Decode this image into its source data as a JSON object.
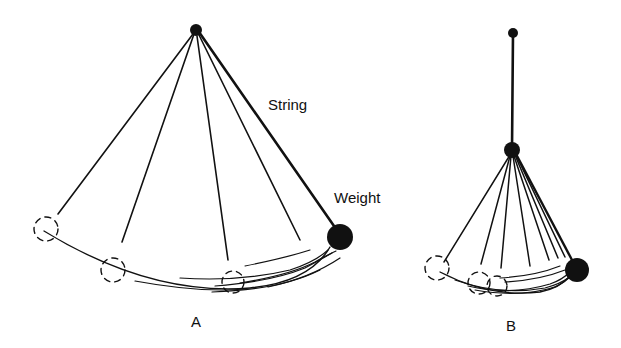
{
  "diagram": {
    "panel_a": {
      "caption": "A",
      "string_label": "String",
      "weight_label": "Weight",
      "pivot": {
        "x": 196,
        "y": 30,
        "r": 6
      },
      "weight": {
        "x": 340,
        "y": 237,
        "r": 13
      },
      "swing_lines_end": [
        [
          58,
          214
        ],
        [
          122,
          242
        ],
        [
          228,
          260
        ],
        [
          300,
          240
        ]
      ],
      "ghost_positions": [
        [
          43,
          229,
          12
        ],
        [
          113,
          268,
          12
        ],
        [
          233,
          282,
          12
        ]
      ]
    },
    "panel_b": {
      "caption": "B",
      "top_pivot": {
        "x": 513,
        "y": 33,
        "r": 5
      },
      "mid_pivot": {
        "x": 512,
        "y": 149,
        "r": 8
      },
      "weight": {
        "x": 577,
        "y": 270,
        "r": 12
      },
      "ghost_positions": [
        [
          437,
          268,
          12
        ],
        [
          479,
          282,
          12
        ],
        [
          496,
          286,
          11
        ]
      ]
    }
  }
}
